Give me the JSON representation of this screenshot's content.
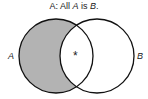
{
  "title": {
    "prefix": "A:  All ",
    "a": "A",
    "mid": " is ",
    "b": "B",
    "suffix": "."
  },
  "labels": {
    "left": "A",
    "right": "B",
    "mark": "*"
  },
  "colors": {
    "shade": "#b3b3b3",
    "stroke": "#111111"
  },
  "diagram": {
    "type": "venn",
    "sets": [
      "A",
      "B"
    ],
    "shaded_regions": [
      "A only"
    ],
    "marked_regions": [
      "A and B"
    ]
  }
}
